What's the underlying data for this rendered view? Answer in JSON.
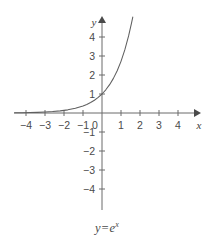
{
  "chart_data": {
    "type": "line",
    "title": "",
    "caption": "y=e",
    "caption_exponent": "x",
    "function": "y = e^x",
    "xlabel": "x",
    "ylabel": "y",
    "xlim": [
      -4.6,
      5.0
    ],
    "ylim": [
      -4.8,
      5.0
    ],
    "xticks": [
      -4,
      -3,
      -2,
      -1,
      0,
      1,
      2,
      3,
      4
    ],
    "yticks": [
      4,
      3,
      2,
      1,
      -1,
      -2,
      -3,
      -4
    ],
    "xtick_labels": [
      "−4",
      "−3",
      "−2",
      "−1",
      "0",
      "1",
      "2",
      "3",
      "4"
    ],
    "ytick_labels": [
      "4",
      "3",
      "2",
      "1",
      "−1",
      "−2",
      "−3",
      "−4"
    ],
    "grid": false,
    "legend": false,
    "axis_arrows": [
      "x-positive",
      "y-positive"
    ],
    "series": [
      {
        "name": "y=e^x",
        "color": "#5f5f5f",
        "points": [
          [
            -4.6,
            0.01
          ],
          [
            -4.2,
            0.015
          ],
          [
            -3.8,
            0.022
          ],
          [
            -3.4,
            0.033
          ],
          [
            -3.0,
            0.05
          ],
          [
            -2.6,
            0.074
          ],
          [
            -2.2,
            0.111
          ],
          [
            -1.8,
            0.165
          ],
          [
            -1.4,
            0.247
          ],
          [
            -1.0,
            0.368
          ],
          [
            -0.8,
            0.449
          ],
          [
            -0.6,
            0.549
          ],
          [
            -0.4,
            0.67
          ],
          [
            -0.2,
            0.819
          ],
          [
            0.0,
            1.0
          ],
          [
            0.2,
            1.221
          ],
          [
            0.4,
            1.492
          ],
          [
            0.6,
            1.822
          ],
          [
            0.8,
            2.226
          ],
          [
            1.0,
            2.718
          ],
          [
            1.2,
            3.32
          ],
          [
            1.4,
            4.055
          ],
          [
            1.55,
            4.715
          ],
          [
            1.62,
            5.05
          ]
        ]
      }
    ]
  },
  "axes": {
    "x_axis_name": "x",
    "y_axis_name": "y"
  }
}
